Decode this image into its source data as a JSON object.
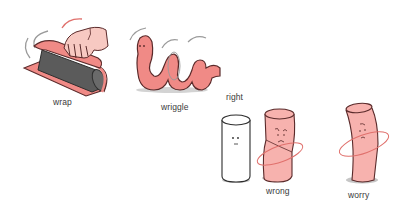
{
  "colors": {
    "pink": "#f08a86",
    "pink_light": "#f7b2ae",
    "outline": "#5a2a2a",
    "gray_roll": "#5b5b5b",
    "shadow": "#bdbdbd",
    "motion": "#9a9a9a",
    "ring": "#e0706c"
  },
  "words": [
    {
      "id": "wrap",
      "label": "wrap",
      "icon": "rolling-mat-illustration"
    },
    {
      "id": "wriggle",
      "label": "wriggle",
      "icon": "worm-illustration"
    },
    {
      "id": "right",
      "label": "right",
      "icon": "white-cylinder-illustration"
    },
    {
      "id": "wrong",
      "label": "wrong",
      "icon": "twisted-cylinder-illustration"
    },
    {
      "id": "worry",
      "label": "worry",
      "icon": "bent-cylinder-illustration"
    }
  ]
}
